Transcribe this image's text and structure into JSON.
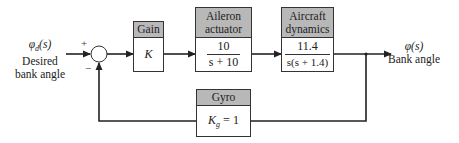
{
  "diagram": {
    "type": "closed-loop feedback block diagram",
    "input": {
      "symbol": "φ",
      "subscript": "d",
      "arg": "(s)",
      "line1": "Desired",
      "line2": "bank angle"
    },
    "summing_junction": {
      "plus_sign": "+",
      "minus_sign": "−"
    },
    "blocks": [
      {
        "id": "gain",
        "title": "Gain",
        "title_line2": "",
        "content": "K"
      },
      {
        "id": "aileron",
        "title": "Aileron",
        "title_line2": "actuator",
        "numerator": "10",
        "denominator": "s + 10"
      },
      {
        "id": "aircraft",
        "title": "Aircraft",
        "title_line2": "dynamics",
        "numerator": "11.4",
        "denominator": "s(s + 1.4)"
      },
      {
        "id": "gyro",
        "title": "Gyro",
        "title_line2": "",
        "content_symbol": "K",
        "content_subscript": "g",
        "content_rest": " = 1"
      }
    ],
    "output": {
      "symbol": "φ(s)",
      "line1": "Bank angle"
    },
    "colors": {
      "header_fill": "#b8b8b8",
      "line": "#333333",
      "background": "#ffffff"
    }
  }
}
